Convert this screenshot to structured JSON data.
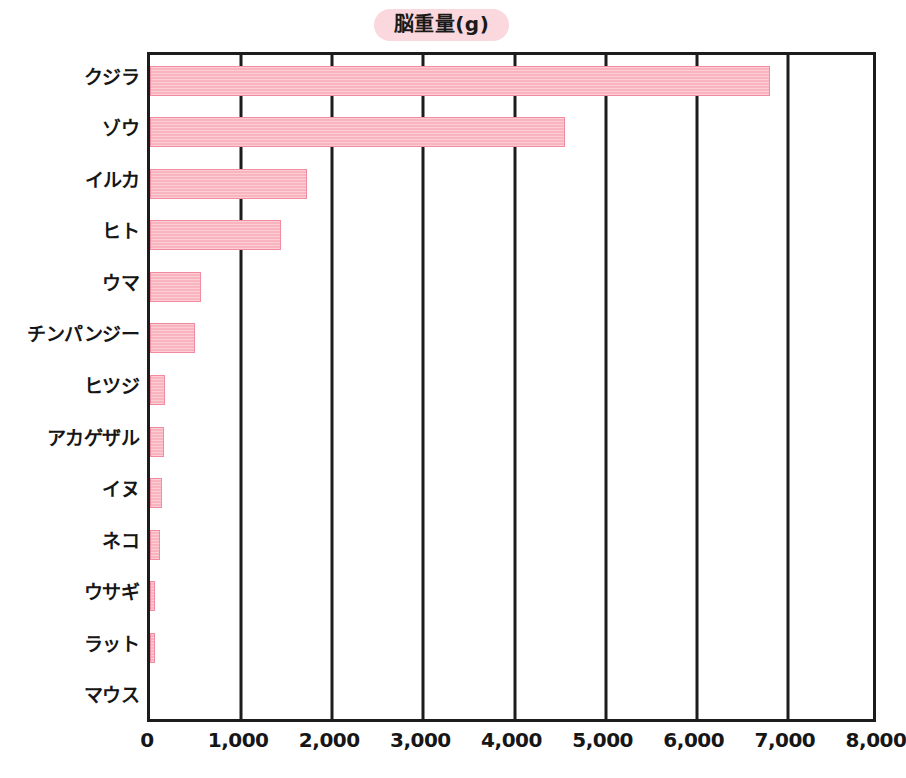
{
  "chart_data": {
    "type": "bar",
    "orientation": "horizontal",
    "title": "脳重量(g)",
    "xlabel": "",
    "ylabel": "",
    "xlim": [
      0,
      8000
    ],
    "xticks": [
      "0",
      "1,000",
      "2,000",
      "3,000",
      "4,000",
      "5,000",
      "6,000",
      "7,000",
      "8,000"
    ],
    "xtick_values": [
      0,
      1000,
      2000,
      3000,
      4000,
      5000,
      6000,
      7000,
      8000
    ],
    "grid": "vertical",
    "legend": "none",
    "bar_color": "#fab4c0",
    "bar_border_color": "#f08ba0",
    "axis_color": "#1c1c1c",
    "title_badge_color": "#fbd8de",
    "categories": [
      "クジラ",
      "ゾウ",
      "イルカ",
      "ヒト",
      "ウマ",
      "チンパンジー",
      "ヒツジ",
      "アカゲザル",
      "イヌ",
      "ネコ",
      "ウサギ",
      "ラット",
      "マウス"
    ],
    "values": [
      6800,
      4550,
      1720,
      1440,
      560,
      490,
      170,
      150,
      135,
      110,
      60,
      60,
      0
    ]
  }
}
